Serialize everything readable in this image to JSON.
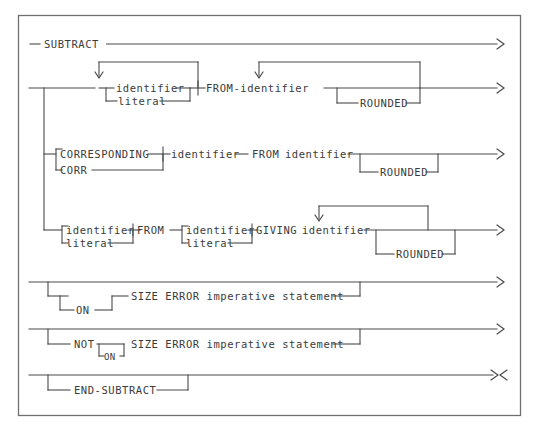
{
  "diagram": {
    "type": "railroad-syntax-diagram",
    "title": "SUBTRACT",
    "line_color": "#4a4a4a",
    "frame_color": "#707070",
    "background": "#ffffff",
    "start_symbol": "—",
    "continue_symbol": ">",
    "terminator_symbol": "><",
    "tokens": {
      "subtract": "SUBTRACT",
      "identifier": "identifier",
      "literal": "literal",
      "from_identifier": "FROM-identifier",
      "from": "FROM",
      "rounded": "ROUNDED",
      "corresponding": "CORRESPONDING",
      "corr": "CORR",
      "giving": "GIVING",
      "on": "ON",
      "not": "NOT",
      "size_error_imperative": "SIZE ERROR imperative statement",
      "end_subtract": "END-SUBTRACT"
    },
    "rows": [
      {
        "id": "row-subtract",
        "labels": [
          "SUBTRACT"
        ],
        "end": ">"
      },
      {
        "id": "row-basic-format",
        "labels": [
          "identifier",
          "literal",
          "FROM-identifier",
          "ROUNDED"
        ],
        "end": ">"
      },
      {
        "id": "row-corresponding-format",
        "labels": [
          "CORRESPONDING",
          "CORR",
          "identifier",
          "FROM identifier",
          "ROUNDED"
        ],
        "end": ">"
      },
      {
        "id": "row-giving-format",
        "labels": [
          "identifier",
          "literal",
          "FROM",
          "identifier",
          "literal",
          "GIVING identifier",
          "ROUNDED"
        ],
        "end": ">"
      },
      {
        "id": "row-on-size-error",
        "labels": [
          "ON",
          "SIZE ERROR imperative statement"
        ],
        "end": ">"
      },
      {
        "id": "row-not-on-size-error",
        "labels": [
          "NOT",
          "ON",
          "SIZE ERROR imperative statement"
        ],
        "end": ">"
      },
      {
        "id": "row-end-subtract",
        "labels": [
          "END-SUBTRACT"
        ],
        "end": "><"
      }
    ]
  }
}
